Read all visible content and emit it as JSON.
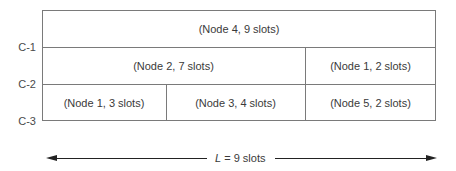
{
  "diagram": {
    "type": "slot-allocation-grid",
    "rows": [
      {
        "cells": [
          {
            "label": "(Node 4, 9 slots)",
            "node": 4,
            "slots": 9
          }
        ]
      },
      {
        "cells": [
          {
            "label": "(Node 2, 7 slots)",
            "node": 2,
            "slots": 7
          },
          {
            "label": "(Node 1, 2 slots)",
            "node": 1,
            "slots": 2
          }
        ]
      },
      {
        "cells": [
          {
            "label": "(Node 1, 3 slots)",
            "node": 1,
            "slots": 3
          },
          {
            "label": "(Node 3, 4 slots)",
            "node": 3,
            "slots": 4
          },
          {
            "label": "(Node 5, 2 slots)",
            "node": 5,
            "slots": 2
          }
        ]
      }
    ],
    "row_boundaries": [
      "C-1",
      "C-2",
      "C-3"
    ],
    "length": {
      "variable": "L",
      "equals": " = 9 slots",
      "value": 9,
      "unit": "slots"
    }
  }
}
